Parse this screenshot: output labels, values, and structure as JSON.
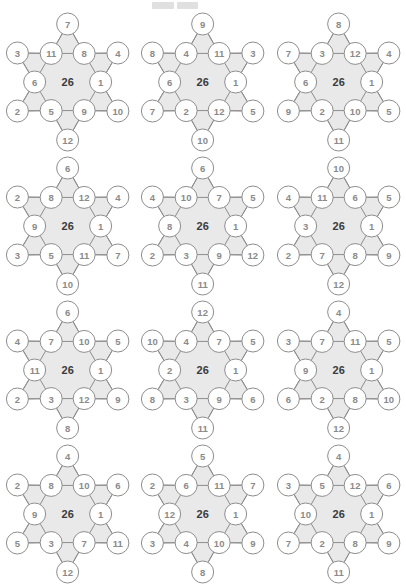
{
  "page": {
    "center_value": "26",
    "colors": {
      "star_fill": "#e9e9e9",
      "star_stroke": "#8d8d8d",
      "node_fill": "#ffffff",
      "node_stroke": "#8d8d8d",
      "node_text": "#8a8a8a",
      "center_text": "#3a3a3a",
      "background": "#ffffff"
    },
    "layout": {
      "columns": 3,
      "rows": 4,
      "total_puzzles": 12
    },
    "node_order": [
      "top-point",
      "upper-left-point",
      "inner-upper-left",
      "inner-upper-right",
      "upper-right-point",
      "left-middle",
      "right-middle",
      "lower-left-point",
      "inner-lower-left",
      "inner-lower-right",
      "lower-right-point",
      "bottom-point"
    ]
  },
  "puzzles": [
    {
      "id": "puzzle-1",
      "row": 1,
      "col": 1,
      "center": "26",
      "nodes": {
        "top": "7",
        "ul_point": "3",
        "in_ul": "11",
        "in_ur": "8",
        "ur_point": "4",
        "left_mid": "6",
        "right_mid": "1",
        "ll_point": "2",
        "in_ll": "5",
        "in_lr": "9",
        "lr_point": "10",
        "bottom": "12"
      }
    },
    {
      "id": "puzzle-2",
      "row": 1,
      "col": 2,
      "center": "26",
      "nodes": {
        "top": "9",
        "ul_point": "8",
        "in_ul": "4",
        "in_ur": "11",
        "ur_point": "3",
        "left_mid": "6",
        "right_mid": "1",
        "ll_point": "7",
        "in_ll": "2",
        "in_lr": "12",
        "lr_point": "5",
        "bottom": "10"
      }
    },
    {
      "id": "puzzle-3",
      "row": 1,
      "col": 3,
      "center": "26",
      "nodes": {
        "top": "8",
        "ul_point": "7",
        "in_ul": "3",
        "in_ur": "12",
        "ur_point": "4",
        "left_mid": "6",
        "right_mid": "1",
        "ll_point": "9",
        "in_ll": "2",
        "in_lr": "10",
        "lr_point": "5",
        "bottom": "11"
      }
    },
    {
      "id": "puzzle-4",
      "row": 2,
      "col": 1,
      "center": "26",
      "nodes": {
        "top": "6",
        "ul_point": "2",
        "in_ul": "8",
        "in_ur": "12",
        "ur_point": "4",
        "left_mid": "9",
        "right_mid": "1",
        "ll_point": "3",
        "in_ll": "5",
        "in_lr": "11",
        "lr_point": "7",
        "bottom": "10"
      }
    },
    {
      "id": "puzzle-5",
      "row": 2,
      "col": 2,
      "center": "26",
      "nodes": {
        "top": "6",
        "ul_point": "4",
        "in_ul": "10",
        "in_ur": "7",
        "ur_point": "5",
        "left_mid": "8",
        "right_mid": "1",
        "ll_point": "2",
        "in_ll": "3",
        "in_lr": "9",
        "lr_point": "12",
        "bottom": "11"
      }
    },
    {
      "id": "puzzle-6",
      "row": 2,
      "col": 3,
      "center": "26",
      "nodes": {
        "top": "10",
        "ul_point": "4",
        "in_ul": "11",
        "in_ur": "6",
        "ur_point": "5",
        "left_mid": "3",
        "right_mid": "1",
        "ll_point": "2",
        "in_ll": "7",
        "in_lr": "8",
        "lr_point": "9",
        "bottom": "12"
      }
    },
    {
      "id": "puzzle-7",
      "row": 3,
      "col": 1,
      "center": "26",
      "nodes": {
        "top": "6",
        "ul_point": "4",
        "in_ul": "7",
        "in_ur": "10",
        "ur_point": "5",
        "left_mid": "11",
        "right_mid": "1",
        "ll_point": "2",
        "in_ll": "3",
        "in_lr": "12",
        "lr_point": "9",
        "bottom": "8"
      }
    },
    {
      "id": "puzzle-8",
      "row": 3,
      "col": 2,
      "center": "26",
      "nodes": {
        "top": "12",
        "ul_point": "10",
        "in_ul": "4",
        "in_ur": "7",
        "ur_point": "5",
        "left_mid": "2",
        "right_mid": "1",
        "ll_point": "8",
        "in_ll": "3",
        "in_lr": "9",
        "lr_point": "6",
        "bottom": "11"
      }
    },
    {
      "id": "puzzle-9",
      "row": 3,
      "col": 3,
      "center": "26",
      "nodes": {
        "top": "4",
        "ul_point": "3",
        "in_ul": "7",
        "in_ur": "11",
        "ur_point": "5",
        "left_mid": "9",
        "right_mid": "1",
        "ll_point": "6",
        "in_ll": "2",
        "in_lr": "8",
        "lr_point": "10",
        "bottom": "12"
      }
    },
    {
      "id": "puzzle-10",
      "row": 4,
      "col": 1,
      "center": "26",
      "nodes": {
        "top": "4",
        "ul_point": "2",
        "in_ul": "8",
        "in_ur": "10",
        "ur_point": "6",
        "left_mid": "9",
        "right_mid": "1",
        "ll_point": "5",
        "in_ll": "3",
        "in_lr": "7",
        "lr_point": "11",
        "bottom": "12"
      }
    },
    {
      "id": "puzzle-11",
      "row": 4,
      "col": 2,
      "center": "26",
      "nodes": {
        "top": "5",
        "ul_point": "2",
        "in_ul": "6",
        "in_ur": "11",
        "ur_point": "7",
        "left_mid": "12",
        "right_mid": "1",
        "ll_point": "3",
        "in_ll": "4",
        "in_lr": "10",
        "lr_point": "9",
        "bottom": "8"
      }
    },
    {
      "id": "puzzle-12",
      "row": 4,
      "col": 3,
      "center": "26",
      "nodes": {
        "top": "4",
        "ul_point": "3",
        "in_ul": "5",
        "in_ur": "12",
        "ur_point": "6",
        "left_mid": "10",
        "right_mid": "1",
        "ll_point": "7",
        "in_ll": "2",
        "in_lr": "8",
        "lr_point": "9",
        "bottom": "11"
      }
    }
  ]
}
